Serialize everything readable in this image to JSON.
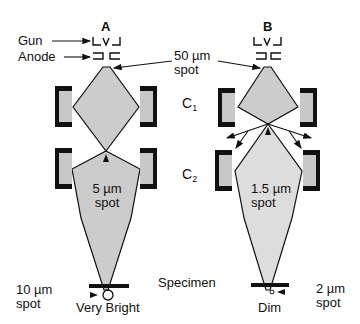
{
  "columns": {
    "A": {
      "header": "A",
      "mid_spot_label": [
        "5 µm",
        "spot"
      ],
      "bottom_spot_label": [
        "10 µm",
        "spot"
      ],
      "brightness_label": "Very Bright"
    },
    "B": {
      "header": "B",
      "mid_spot_label": [
        "1.5 µm",
        "spot"
      ],
      "bottom_spot_label": [
        "2 µm",
        "spot"
      ],
      "brightness_label": "Dim"
    }
  },
  "labels": {
    "gun": "Gun",
    "anode": "Anode",
    "top_spot": [
      "50 µm",
      "spot"
    ],
    "c1": "C",
    "c1_sub": "1",
    "c2": "C",
    "c2_sub": "2",
    "specimen": "Specimen"
  },
  "colors": {
    "beam_fill": "#cccccc",
    "lens_fill": "#c8c8c8",
    "lens_frame": "#111111",
    "line": "#111111"
  }
}
